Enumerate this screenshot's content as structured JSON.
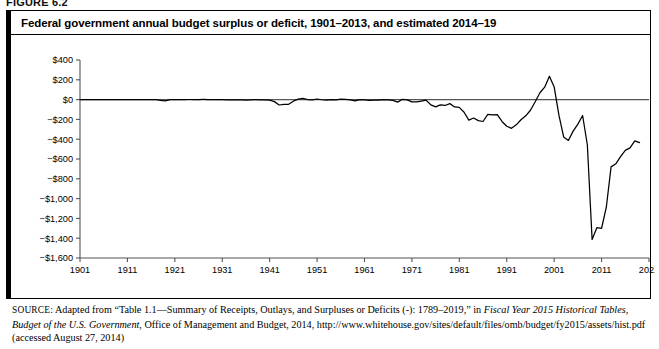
{
  "figure": {
    "label": "FIGURE 6.2",
    "title": "Federal government annual budget surplus or deficit, 1901–2013, and estimated 2014–19"
  },
  "source": {
    "label": "SOURCE:",
    "line1_a": " Adapted from “Table 1.1—Summary of Receipts, Outlays, and Surpluses or Deficits (-): 1789–2019,” in ",
    "line1_italic": "Fiscal Year 2015 Historical Tables,",
    "line2_italic": "Budget of the U.S. Government",
    "line2_b": ", Office of Management and Budget, 2014, http://www.whitehouse.gov/sites/default/files/omb/budget/fy2015/assets/hist",
    "line3": ".pdf (accessed August 27, 2014)"
  },
  "chart_data": {
    "type": "line",
    "title": "Federal government annual budget surplus or deficit, 1901–2013, and estimated 2014–19",
    "xlabel": "",
    "ylabel": "",
    "units": "billions of dollars",
    "xlim": [
      1901,
      2021
    ],
    "ylim": [
      -1600,
      400
    ],
    "grid": false,
    "legend": "none",
    "ytick_labels": [
      "$400",
      "$200",
      "$0",
      "−$200",
      "−$400",
      "−$600",
      "−$800",
      "−$1,000",
      "−$1,200",
      "−$1,400",
      "−$1,600"
    ],
    "ytick_values": [
      400,
      200,
      0,
      -200,
      -400,
      -600,
      -800,
      -1000,
      -1200,
      -1400,
      -1600
    ],
    "xtick_labels": [
      "1901",
      "1911",
      "1921",
      "1931",
      "1941",
      "1951",
      "1961",
      "1971",
      "1981",
      "1991",
      "2001",
      "2011",
      "2021"
    ],
    "xtick_values": [
      1901,
      1911,
      1921,
      1931,
      1941,
      1951,
      1961,
      1971,
      1981,
      1991,
      2001,
      2011,
      2021
    ],
    "series": [
      {
        "name": "Annual surplus or deficit",
        "color": "#000000",
        "x": [
          1901,
          1902,
          1903,
          1904,
          1905,
          1906,
          1907,
          1908,
          1909,
          1910,
          1911,
          1912,
          1913,
          1914,
          1915,
          1916,
          1917,
          1918,
          1919,
          1920,
          1921,
          1922,
          1923,
          1924,
          1925,
          1926,
          1927,
          1928,
          1929,
          1930,
          1931,
          1932,
          1933,
          1934,
          1935,
          1936,
          1937,
          1938,
          1939,
          1940,
          1941,
          1942,
          1943,
          1944,
          1945,
          1946,
          1947,
          1948,
          1949,
          1950,
          1951,
          1952,
          1953,
          1954,
          1955,
          1956,
          1957,
          1958,
          1959,
          1960,
          1961,
          1962,
          1963,
          1964,
          1965,
          1966,
          1967,
          1968,
          1969,
          1970,
          1971,
          1972,
          1973,
          1974,
          1975,
          1976,
          1977,
          1978,
          1979,
          1980,
          1981,
          1982,
          1983,
          1984,
          1985,
          1986,
          1987,
          1988,
          1989,
          1990,
          1991,
          1992,
          1993,
          1994,
          1995,
          1996,
          1997,
          1998,
          1999,
          2000,
          2001,
          2002,
          2003,
          2004,
          2005,
          2006,
          2007,
          2008,
          2009,
          2010,
          2011,
          2012,
          2013,
          2014,
          2015,
          2016,
          2017,
          2018,
          2019
        ],
        "values": [
          0.1,
          0.1,
          0.0,
          -0.04,
          -0.02,
          0.03,
          0.09,
          -0.06,
          -0.09,
          -0.02,
          0.01,
          0.0,
          -0.0,
          -0.0,
          -0.06,
          0.05,
          -0.85,
          -9.03,
          -13.36,
          0.29,
          0.51,
          0.74,
          0.71,
          1.0,
          0.72,
          0.87,
          1.16,
          0.94,
          0.73,
          0.74,
          -0.46,
          -2.74,
          -2.6,
          -3.63,
          -2.8,
          -4.3,
          -2.22,
          -0.09,
          -2.85,
          -2.92,
          -4.94,
          -20.5,
          -54.55,
          -47.56,
          -47.55,
          -15.94,
          4.02,
          11.8,
          0.58,
          -3.12,
          6.1,
          -1.52,
          -6.49,
          -1.15,
          -3.04,
          3.95,
          3.41,
          -2.77,
          -12.85,
          0.3,
          -3.34,
          -7.15,
          -4.76,
          -5.92,
          -1.41,
          -3.7,
          -8.64,
          -25.16,
          3.24,
          -2.84,
          -23.03,
          -23.37,
          -14.91,
          -6.14,
          -53.24,
          -73.73,
          -53.66,
          -59.19,
          -40.73,
          -73.83,
          -78.97,
          -127.98,
          -207.8,
          -185.37,
          -212.31,
          -221.23,
          -149.73,
          -155.18,
          -152.64,
          -221.04,
          -269.24,
          -290.32,
          -255.05,
          -203.19,
          -164.0,
          -107.43,
          -21.88,
          69.27,
          125.61,
          236.24,
          128.24,
          -157.76,
          -377.59,
          -412.73,
          -318.35,
          -248.18,
          -160.71,
          -458.55,
          -1412.69,
          -1294.37,
          -1299.59,
          -1086.96,
          -679.5,
          -648.8,
          -576.89,
          -512.97,
          -487.25,
          -416.48,
          -434.0
        ],
        "notable_points": [
          {
            "year": 1918,
            "value": -9.03,
            "note": "World War I"
          },
          {
            "year": 1943,
            "value": -54.55,
            "note": "World War II peak deficit"
          },
          {
            "year": 2000,
            "value": 236.24,
            "note": "Largest surplus"
          },
          {
            "year": 2009,
            "value": -1412.69,
            "note": "Largest deficit"
          },
          {
            "year": 2019,
            "value": -434.0,
            "note": "Estimated"
          }
        ]
      }
    ]
  }
}
